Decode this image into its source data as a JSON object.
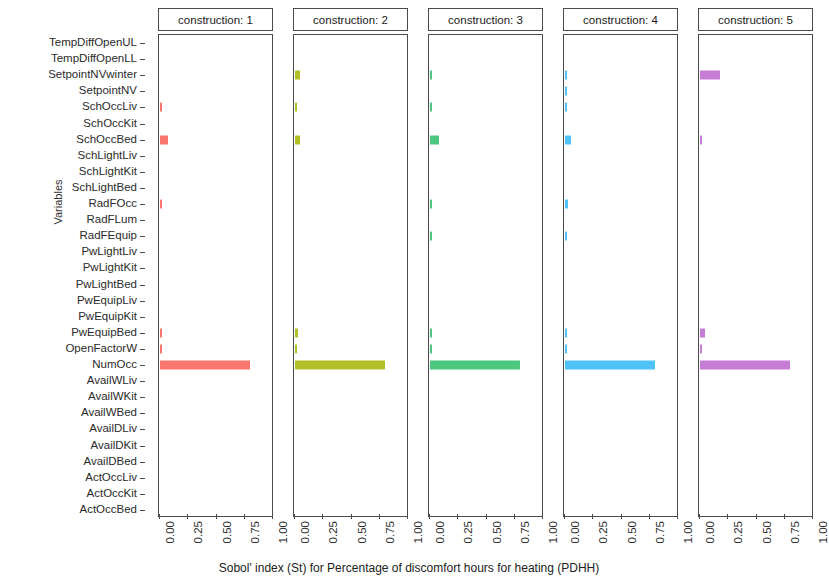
{
  "chart_data": {
    "type": "bar",
    "title": "",
    "orientation": "horizontal",
    "xlabel": "Sobol' index (St) for Percentage of discomfort hours for heating (PDHH)",
    "ylabel": "Variables",
    "xlim": [
      0.0,
      1.0
    ],
    "xticks": [
      "0.00",
      "0.25",
      "0.50",
      "0.75",
      "1.00"
    ],
    "xtickvalues": [
      0.0,
      0.25,
      0.5,
      0.75,
      1.0
    ],
    "grid": false,
    "legend": "none",
    "facet_variable": "construction",
    "facet_labels": [
      "construction: 1",
      "construction: 2",
      "construction: 3",
      "construction: 4",
      "construction: 5"
    ],
    "categories": [
      "TempDiffOpenUL",
      "TempDiffOpenLL",
      "SetpointNVwinter",
      "SetpointNV",
      "SchOccLiv",
      "SchOccKit",
      "SchOccBed",
      "SchLightLiv",
      "SchLightKit",
      "SchLightBed",
      "RadFOcc",
      "RadFLum",
      "RadFEquip",
      "PwLightLiv",
      "PwLightKit",
      "PwLightBed",
      "PwEquipLiv",
      "PwEquipKit",
      "PwEquipBed",
      "OpenFactorW",
      "NumOcc",
      "AvailWLiv",
      "AvailWKit",
      "AvailWBed",
      "AvailDLiv",
      "AvailDKit",
      "AvailDBed",
      "ActOccLiv",
      "ActOccKit",
      "ActOccBed"
    ],
    "series": [
      {
        "name": "construction: 1",
        "color": "#F8766D",
        "values": [
          0.0,
          0.0,
          0.0,
          0.0,
          0.012,
          0.0,
          0.075,
          0.0,
          0.0,
          0.0,
          0.006,
          0.0,
          0.0,
          0.0,
          0.0,
          0.0,
          0.0,
          0.0,
          0.01,
          0.004,
          0.8,
          0.0,
          0.0,
          0.0,
          0.0,
          0.0,
          0.0,
          0.0,
          0.0,
          0.0
        ]
      },
      {
        "name": "construction: 2",
        "color": "#B3BF27",
        "values": [
          0.0,
          0.0,
          0.04,
          0.0,
          0.006,
          0.0,
          0.04,
          0.0,
          0.0,
          0.0,
          0.0,
          0.0,
          0.0,
          0.0,
          0.0,
          0.0,
          0.0,
          0.0,
          0.03,
          0.012,
          0.8,
          0.0,
          0.0,
          0.0,
          0.0,
          0.0,
          0.0,
          0.0,
          0.0,
          0.0
        ]
      },
      {
        "name": "construction: 3",
        "color": "#4BC77E",
        "values": [
          0.0,
          0.0,
          0.008,
          0.0,
          0.014,
          0.0,
          0.08,
          0.0,
          0.0,
          0.0,
          0.014,
          0.0,
          0.006,
          0.0,
          0.0,
          0.0,
          0.0,
          0.0,
          0.018,
          0.006,
          0.8,
          0.0,
          0.0,
          0.0,
          0.0,
          0.0,
          0.0,
          0.0,
          0.0,
          0.0
        ]
      },
      {
        "name": "construction: 4",
        "color": "#4FC3F7"
      },
      {
        "name": "construction: 5",
        "color": "#C77CD4"
      }
    ],
    "series4_values": [
      0.0,
      0.0,
      0.01,
      0.006,
      0.01,
      0.0,
      0.055,
      0.0,
      0.0,
      0.0,
      0.03,
      0.0,
      0.006,
      0.0,
      0.0,
      0.0,
      0.0,
      0.0,
      0.012,
      0.006,
      0.8,
      0.0,
      0.0,
      0.0,
      0.0,
      0.0,
      0.0,
      0.0,
      0.0,
      0.0
    ],
    "series5_values": [
      0.0,
      0.0,
      0.175,
      0.0,
      0.0,
      0.0,
      0.006,
      0.0,
      0.0,
      0.0,
      0.0,
      0.0,
      0.0,
      0.0,
      0.0,
      0.0,
      0.0,
      0.0,
      0.04,
      0.016,
      0.8,
      0.0,
      0.0,
      0.0,
      0.0,
      0.0,
      0.0,
      0.0,
      0.0,
      0.0
    ]
  },
  "axes": {
    "ylabel_text": "Variables",
    "xlabel_text": "Sobol' index (St) for Percentage of discomfort hours for heating (PDHH)"
  }
}
